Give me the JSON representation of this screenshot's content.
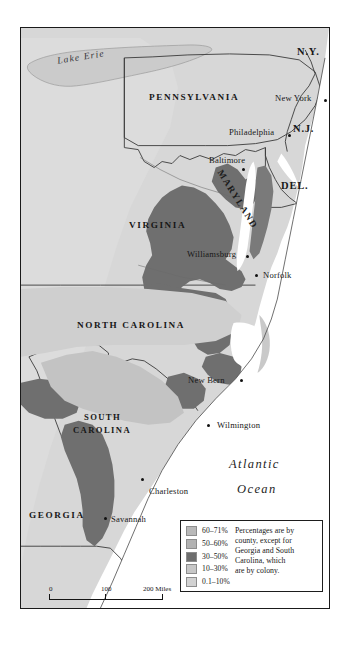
{
  "map": {
    "title": "Slave population density in the southern British colonies",
    "water_labels": [
      {
        "name": "Lake Erie",
        "text": "Lake Erie"
      }
    ],
    "ocean_label": {
      "line1": "Atlantic",
      "line2": "Ocean"
    },
    "states": [
      {
        "id": "pennsylvania",
        "text": "PENNSYLVANIA"
      },
      {
        "id": "virginia",
        "text": "VIRGINIA"
      },
      {
        "id": "north-carolina",
        "text": "NORTH CAROLINA"
      },
      {
        "id": "south-carolina-1",
        "text": "SOUTH"
      },
      {
        "id": "south-carolina-2",
        "text": "CAROLINA"
      },
      {
        "id": "georgia",
        "text": "GEORGIA"
      },
      {
        "id": "maryland",
        "text": "MARYLAND"
      }
    ],
    "abbreviations": [
      {
        "id": "new-york",
        "text": "N.Y."
      },
      {
        "id": "new-jersey",
        "text": "N.J."
      },
      {
        "id": "delaware",
        "text": "DEL."
      }
    ],
    "cities": [
      {
        "id": "new-york-city",
        "text": "New York"
      },
      {
        "id": "philadelphia",
        "text": "Philadelphia"
      },
      {
        "id": "baltimore",
        "text": "Baltimore"
      },
      {
        "id": "williamsburg",
        "text": "Williamsburg"
      },
      {
        "id": "norfolk",
        "text": "Norfolk"
      },
      {
        "id": "new-bern",
        "text": "New Bern"
      },
      {
        "id": "wilmington",
        "text": "Wilmington"
      },
      {
        "id": "charleston",
        "text": "Charleston"
      },
      {
        "id": "savannah",
        "text": "Savannah"
      }
    ]
  },
  "legend": {
    "entries": [
      {
        "range": "60–71%",
        "color": "#b9b9b9"
      },
      {
        "range": "50–60%",
        "color": "#b2b2b2"
      },
      {
        "range": "30–50%",
        "color": "#6e6e6e"
      },
      {
        "range": "10–30%",
        "color": "#c7c7c7"
      },
      {
        "range": "0.1–10%",
        "color": "#d2d2d2"
      }
    ],
    "note": "Percentages are by county, except for Georgia and South Carolina, which are by colony."
  },
  "scale": {
    "miles": {
      "t0": "0",
      "t1": "100",
      "t2": "200 Miles"
    },
    "kilometers": {
      "t0": "0",
      "caption": "200 Kilometers"
    }
  },
  "colors": {
    "land_light": "#d8d8d8",
    "land_mid": "#c3c3c3",
    "land_dark": "#6f6f6f",
    "ocean": "#ffffff",
    "lake": "#cfcfcf",
    "outline": "#2b2b2b"
  }
}
